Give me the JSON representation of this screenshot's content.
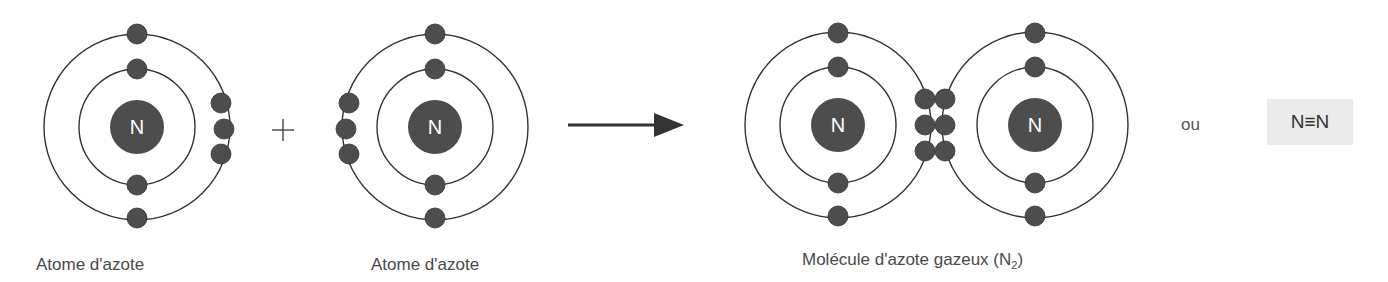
{
  "colors": {
    "orbit": "#333333",
    "electron": "#4d4d4d",
    "nucleus": "#4d4d4d",
    "nucleus_text": "#ffffff",
    "label": "#4a4a4a",
    "formula_bg": "#ebebeb"
  },
  "reactants": [
    {
      "name": "atom-1",
      "symbol": "N",
      "label": "Atome d'azote"
    },
    {
      "name": "atom-2",
      "symbol": "N",
      "label": "Atome d'azote"
    }
  ],
  "operator": "+",
  "arrow": "reaction-arrow",
  "product": {
    "symbols": [
      "N",
      "N"
    ],
    "label_prefix": "Molécule d'azote gazeux (N",
    "label_sub": "2",
    "label_suffix": ")"
  },
  "alternative": {
    "connector": "ou",
    "formula": "N≡N"
  }
}
